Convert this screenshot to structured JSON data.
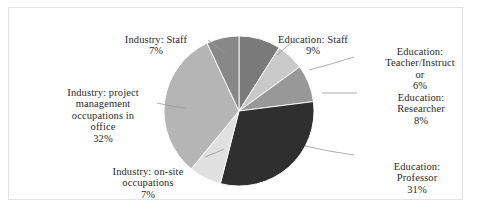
{
  "chart_data": {
    "type": "pie",
    "title": "",
    "labels": [
      "Education: Staff",
      "Education: Teacher/Instructor",
      "Education: Researcher",
      "Education: Professor",
      "Industry: on-site occupations",
      "Industry: project management occupations in office",
      "Industry: Staff"
    ],
    "values": [
      9,
      6,
      8,
      31,
      7,
      32,
      7
    ],
    "value_unit": "%",
    "start_angle": 90,
    "direction": "clockwise",
    "legend": "none",
    "grid": false,
    "slices": [
      {
        "name": "Education: Staff",
        "label_text": "Education: Staff",
        "percent_text": "9%",
        "value": 9,
        "color": "#7a7a7a"
      },
      {
        "name": "Education: Teacher/Instructor",
        "label_text": "Education:\nTeacher/Instruct\nor",
        "percent_text": "6%",
        "value": 6,
        "color": "#c9c9c9"
      },
      {
        "name": "Education: Researcher",
        "label_text": "Education:\nResearcher",
        "percent_text": "8%",
        "value": 8,
        "color": "#989898"
      },
      {
        "name": "Education: Professor",
        "label_text": "Education:\nProfessor",
        "percent_text": "31%",
        "value": 31,
        "color": "#2f2f2f"
      },
      {
        "name": "Industry: on-site occupations",
        "label_text": "Industry: on-site\noccupations",
        "percent_text": "7%",
        "value": 7,
        "color": "#e0e0e0"
      },
      {
        "name": "Industry: project management occupations in office",
        "label_text": "Industry: project\nmanagement\noccupations in\noffice",
        "percent_text": "32%",
        "value": 32,
        "color": "#b5b5b5"
      },
      {
        "name": "Industry: Staff",
        "label_text": "Industry: Staff",
        "percent_text": "7%",
        "value": 7,
        "color": "#888888"
      }
    ]
  },
  "geometry": {
    "center_x": 238,
    "center_y": 110,
    "radius": 75
  },
  "colors": {
    "frame_border": "#e3e3e3",
    "background": "#ffffff",
    "text": "#2b2b2b",
    "leader_line": "#9a9a9a",
    "slice_outline": "#ffffff"
  }
}
